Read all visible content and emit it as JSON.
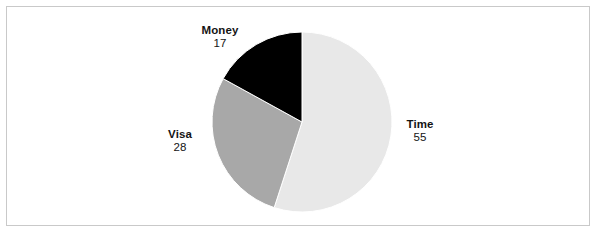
{
  "figure": {
    "background_color": "#ffffff",
    "border_color": "#c9c9c9",
    "width": 599,
    "height": 235
  },
  "chart_data": {
    "type": "pie",
    "title": "",
    "subtitle": "",
    "xlabel": "",
    "ylabel": "",
    "grid": false,
    "legend": "none",
    "labels_position": "outside",
    "start_angle_deg": 0,
    "direction": "clockwise",
    "categories": [
      "Time",
      "Visa",
      "Money"
    ],
    "values": [
      55,
      28,
      17
    ],
    "total": 100,
    "colors": [
      "#e8e8e8",
      "#a8a8a8",
      "#000000"
    ],
    "slice_border_color": "#ffffff",
    "slices": [
      {
        "name": "Time",
        "value": 55,
        "value_text": "55",
        "color": "#e8e8e8",
        "start_angle_deg": 0,
        "end_angle_deg": 198,
        "label_side": "right"
      },
      {
        "name": "Visa",
        "value": 28,
        "value_text": "28",
        "color": "#a8a8a8",
        "start_angle_deg": 198,
        "end_angle_deg": 298.8,
        "label_side": "left"
      },
      {
        "name": "Money",
        "value": 17,
        "value_text": "17",
        "color": "#000000",
        "start_angle_deg": 298.8,
        "end_angle_deg": 360,
        "label_side": "top-left"
      }
    ],
    "geometry": {
      "center_x": 302,
      "center_y": 122,
      "radius": 90
    }
  },
  "labels": {
    "money": {
      "name": "Money",
      "value": "17"
    },
    "visa": {
      "name": "Visa",
      "value": "28"
    },
    "time": {
      "name": "Time",
      "value": "55"
    }
  }
}
